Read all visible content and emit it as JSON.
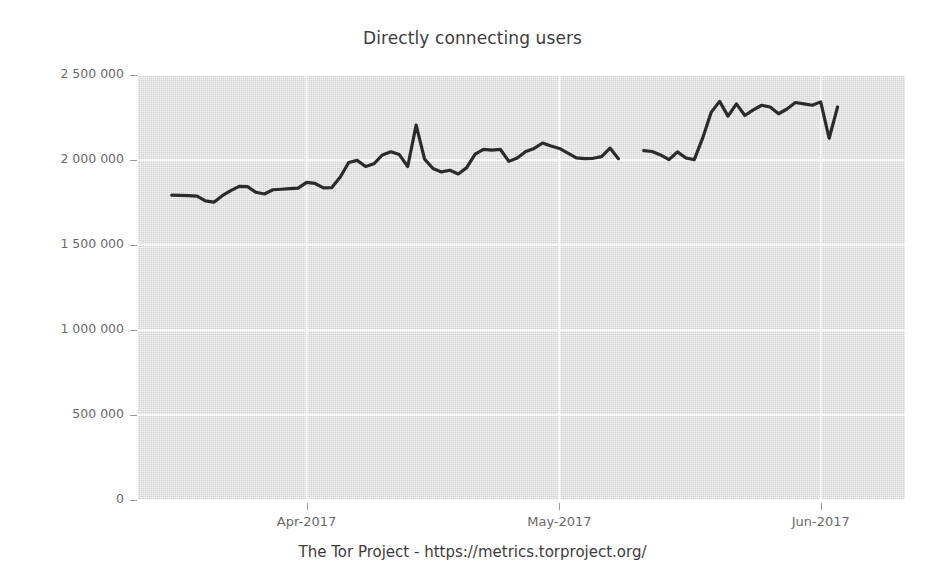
{
  "chart_data": {
    "type": "line",
    "title": "Directly connecting users",
    "caption": "The Tor Project - https://metrics.torproject.org/",
    "xlabel": "",
    "ylabel": "",
    "ylim": [
      0,
      2500000
    ],
    "yticks": [
      0,
      500000,
      1000000,
      1500000,
      2000000,
      2500000
    ],
    "ytick_labels": [
      "0",
      "500 000",
      "1 000 000",
      "1 500 000",
      "2 000 000",
      "2 500 000"
    ],
    "xtick_labels": [
      "Apr-2017",
      "May-2017",
      "Jun-2017"
    ],
    "xlim": [
      "2017-03-12",
      "2017-06-11"
    ],
    "grid": true,
    "legend": "none",
    "line_color": "#2b2b2b",
    "plot_background": "#d4d4d4",
    "gridline_color": "#ffffff",
    "series": [
      {
        "name": "Directly connecting users",
        "x": [
          "2017-03-16",
          "2017-03-17",
          "2017-03-18",
          "2017-03-19",
          "2017-03-20",
          "2017-03-21",
          "2017-03-22",
          "2017-03-23",
          "2017-03-24",
          "2017-03-25",
          "2017-03-26",
          "2017-03-27",
          "2017-03-28",
          "2017-03-29",
          "2017-03-30",
          "2017-03-31",
          "2017-04-01",
          "2017-04-02",
          "2017-04-03",
          "2017-04-04",
          "2017-04-05",
          "2017-04-06",
          "2017-04-07",
          "2017-04-08",
          "2017-04-09",
          "2017-04-10",
          "2017-04-11",
          "2017-04-12",
          "2017-04-13",
          "2017-04-14",
          "2017-04-15",
          "2017-04-16",
          "2017-04-17",
          "2017-04-18",
          "2017-04-19",
          "2017-04-20",
          "2017-04-21",
          "2017-04-22",
          "2017-04-23",
          "2017-04-24",
          "2017-04-25",
          "2017-04-26",
          "2017-04-27",
          "2017-04-28",
          "2017-04-29",
          "2017-04-30",
          "2017-05-01",
          "2017-05-02",
          "2017-05-03",
          "2017-05-04",
          "2017-05-05",
          "2017-05-06",
          "2017-05-07",
          "2017-05-08",
          "2017-05-11",
          "2017-05-12",
          "2017-05-13",
          "2017-05-14",
          "2017-05-15",
          "2017-05-16",
          "2017-05-17",
          "2017-05-18",
          "2017-05-19",
          "2017-05-20",
          "2017-05-21",
          "2017-05-22",
          "2017-05-23",
          "2017-05-24",
          "2017-05-25",
          "2017-05-26",
          "2017-05-27",
          "2017-05-28",
          "2017-05-29",
          "2017-05-30",
          "2017-05-31",
          "2017-06-01",
          "2017-06-02",
          "2017-06-03"
        ],
        "values": [
          1793000,
          1792000,
          1790000,
          1788000,
          1760000,
          1752000,
          1790000,
          1820000,
          1845000,
          1843000,
          1810000,
          1800000,
          1825000,
          1828000,
          1832000,
          1835000,
          1868000,
          1862000,
          1836000,
          1838000,
          1900000,
          1985000,
          1998000,
          1962000,
          1978000,
          2030000,
          2048000,
          2032000,
          1962000,
          2205000,
          2005000,
          1950000,
          1930000,
          1940000,
          1918000,
          1955000,
          2035000,
          2062000,
          2058000,
          2062000,
          1992000,
          2012000,
          2050000,
          2068000,
          2100000,
          2082000,
          2068000,
          2040000,
          2012000,
          2008000,
          2010000,
          2020000,
          2070000,
          2008000,
          2055000,
          2050000,
          2030000,
          2002000,
          2048000,
          2012000,
          2002000,
          2130000,
          2280000,
          2345000,
          2258000,
          2330000,
          2262000,
          2295000,
          2322000,
          2312000,
          2272000,
          2300000,
          2338000,
          2330000,
          2322000,
          2342000,
          2128000,
          2312000
        ],
        "gap_after": "2017-05-08",
        "gap_before": "2017-05-11"
      }
    ],
    "notable_points": [
      {
        "label": "spike",
        "date": "2017-04-14",
        "value": 2205000
      },
      {
        "label": "start",
        "date": "2017-03-16",
        "value": 1793000
      },
      {
        "label": "end",
        "date": "2017-06-03",
        "value": 2312000
      },
      {
        "label": "data-gap",
        "range": [
          "2017-05-09",
          "2017-05-10"
        ]
      }
    ]
  }
}
